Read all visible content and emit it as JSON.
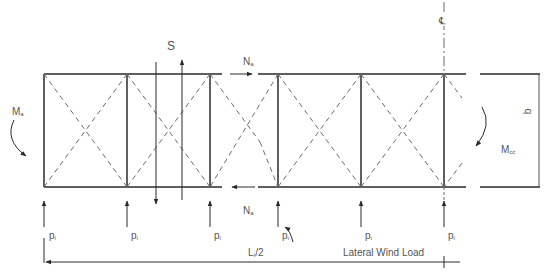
{
  "diagram": {
    "labels": {
      "shear": "S",
      "axial_top": "N",
      "axial_top_sub": "a",
      "axial_bottom": "N",
      "axial_bottom_sub": "a",
      "moment_left": "M",
      "moment_left_sub": "a",
      "moment_center": "M",
      "moment_center_sub": "cc",
      "depth": "b",
      "centerline": "℄",
      "half_span": "L",
      "half_span_sub": "t",
      "half_span_suffix": "/2",
      "wind_load": "Lateral Wind Load",
      "reaction": "p",
      "reaction_sub": "i"
    },
    "reactions": [
      {
        "x": 44,
        "label": "p"
      },
      {
        "x": 127,
        "label": "p"
      },
      {
        "x": 210,
        "label": "p"
      },
      {
        "x": 278,
        "label": "p"
      },
      {
        "x": 361,
        "label": "p"
      },
      {
        "x": 444,
        "label": "p"
      }
    ],
    "colors": {
      "line": "#2a2a2a",
      "dashed": "#6a6a6a",
      "text": "#555555"
    }
  }
}
